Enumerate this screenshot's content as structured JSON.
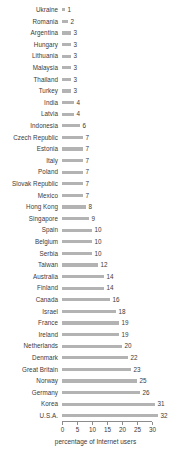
{
  "chart_data": {
    "type": "bar",
    "orientation": "horizontal",
    "title": "",
    "subtitle": "",
    "xlabel": "percentage of Internet users",
    "ylabel": "",
    "xlim": [
      0,
      32
    ],
    "xticks": [
      0,
      5,
      10,
      15,
      20,
      25,
      30
    ],
    "xticklabels": [
      "0",
      "5",
      "10",
      "15",
      "20",
      "25",
      "30"
    ],
    "grid": false,
    "legend": null,
    "bar_color": "#b3b3b3",
    "text_color": "#3a3a3a",
    "axis_color": "#8c8c8c",
    "background": "#ffffff",
    "value_labels_shown": true,
    "categories": [
      "Ukraine",
      "Romania",
      "Argentina",
      "Hungary",
      "Lithuania",
      "Malaysia",
      "Thailand",
      "Turkey",
      "India",
      "Latvia",
      "Indonesia",
      "Czech Republic",
      "Estonia",
      "Italy",
      "Poland",
      "Slovak Republic",
      "Mexico",
      "Hong Kong",
      "Singapore",
      "Spain",
      "Belgium",
      "Serbia",
      "Taiwan",
      "Australia",
      "Finland",
      "Canada",
      "Israel",
      "France",
      "Ireland",
      "Netherlands",
      "Denmark",
      "Great Britain",
      "Norway",
      "Germany",
      "Korea",
      "U.S.A."
    ],
    "values": [
      1,
      2,
      3,
      3,
      3,
      3,
      3,
      3,
      4,
      4,
      6,
      7,
      7,
      7,
      7,
      7,
      7,
      8,
      9,
      10,
      10,
      10,
      12,
      14,
      14,
      16,
      18,
      19,
      19,
      20,
      22,
      23,
      25,
      26,
      31,
      32
    ]
  }
}
